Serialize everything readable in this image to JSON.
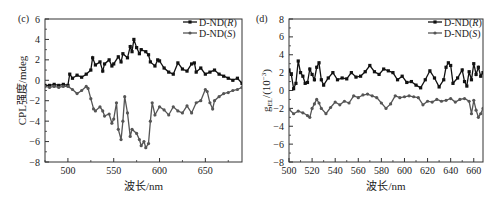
{
  "chart_data": [
    {
      "panel": "(c)",
      "type": "line",
      "title": "",
      "xlabel": "波长/nm",
      "ylabel": "CPL强度/mdeg",
      "xlim": [
        475,
        690
      ],
      "ylim": [
        -8,
        6
      ],
      "xticks": [
        500,
        550,
        600,
        650
      ],
      "yticks": [
        -8,
        -6,
        -4,
        -2,
        0,
        2,
        4,
        6
      ],
      "grid": false,
      "legend_position": "upper right",
      "series": [
        {
          "name": "D-ND(R)",
          "marker": "square",
          "color": "#111111",
          "x": [
            475,
            480,
            485,
            490,
            495,
            500,
            502,
            505,
            510,
            515,
            520,
            525,
            527,
            530,
            535,
            538,
            540,
            545,
            548,
            550,
            555,
            558,
            560,
            565,
            568,
            570,
            572,
            575,
            578,
            580,
            585,
            588,
            590,
            595,
            598,
            600,
            605,
            610,
            615,
            620,
            625,
            630,
            635,
            638,
            640,
            645,
            650,
            655,
            660,
            665,
            670,
            675,
            680,
            685,
            690
          ],
          "values": [
            -0.5,
            -0.5,
            -0.4,
            -0.5,
            -0.4,
            -0.5,
            0.6,
            0.2,
            0.5,
            0.3,
            0.6,
            1.0,
            2.2,
            1.5,
            1.8,
            0.9,
            1.6,
            2.0,
            1.4,
            1.6,
            2.3,
            1.8,
            2.6,
            2.2,
            3.3,
            2.8,
            4.0,
            3.2,
            2.6,
            3.0,
            2.8,
            2.5,
            1.8,
            1.4,
            2.0,
            1.9,
            1.2,
            0.8,
            0.6,
            1.7,
            1.1,
            0.9,
            1.6,
            1.7,
            0.8,
            1.2,
            0.6,
            0.8,
            1.0,
            0.6,
            0.4,
            0.2,
            0.0,
            0.2,
            -0.3
          ]
        },
        {
          "name": "D-ND(S)",
          "marker": "circle",
          "color": "#555555",
          "x": [
            475,
            480,
            485,
            490,
            495,
            500,
            505,
            510,
            515,
            520,
            522,
            525,
            528,
            530,
            535,
            538,
            540,
            545,
            548,
            550,
            553,
            555,
            558,
            560,
            562,
            565,
            568,
            570,
            575,
            578,
            580,
            583,
            585,
            588,
            590,
            592,
            595,
            600,
            605,
            610,
            615,
            620,
            625,
            630,
            635,
            640,
            645,
            650,
            652,
            655,
            658,
            660,
            665,
            670,
            675,
            680,
            685,
            690
          ],
          "values": [
            -0.6,
            -0.7,
            -0.6,
            -0.7,
            -0.6,
            -0.6,
            -0.9,
            -1.3,
            -1.0,
            -0.6,
            -0.8,
            -1.8,
            -2.8,
            -3.0,
            -2.6,
            -3.0,
            -3.5,
            -3.3,
            -4.2,
            -3.8,
            -2.2,
            -4.8,
            -5.8,
            -4.0,
            -1.6,
            -3.2,
            -5.5,
            -4.8,
            -5.2,
            -5.8,
            -6.4,
            -6.0,
            -6.6,
            -6.2,
            -4.0,
            -2.2,
            -3.4,
            -2.6,
            -2.9,
            -3.4,
            -2.6,
            -3.0,
            -3.2,
            -2.5,
            -3.2,
            -2.2,
            -2.0,
            -0.9,
            -1.1,
            -2.2,
            -2.8,
            -2.0,
            -1.6,
            -1.3,
            -1.2,
            -1.0,
            -0.9,
            -0.7
          ]
        }
      ]
    },
    {
      "panel": "(d)",
      "type": "line",
      "title": "",
      "xlabel": "波长/nm",
      "ylabel": "g_EL/(10^-3)",
      "xlim": [
        500,
        668
      ],
      "ylim": [
        -8,
        8
      ],
      "xticks": [
        500,
        520,
        540,
        560,
        580,
        600,
        620,
        640,
        660
      ],
      "yticks": [
        -8,
        -6,
        -4,
        -2,
        0,
        2,
        4,
        6,
        8
      ],
      "grid": false,
      "legend_position": "upper right",
      "series": [
        {
          "name": "D-ND(R)",
          "marker": "square",
          "color": "#111111",
          "x": [
            500,
            502,
            504,
            506,
            508,
            510,
            512,
            514,
            516,
            518,
            520,
            522,
            524,
            526,
            528,
            530,
            534,
            538,
            542,
            546,
            550,
            554,
            558,
            562,
            566,
            570,
            574,
            578,
            582,
            586,
            590,
            594,
            598,
            602,
            606,
            610,
            614,
            618,
            622,
            626,
            630,
            634,
            636,
            638,
            640,
            642,
            646,
            650,
            652,
            654,
            656,
            658,
            660,
            662,
            664,
            666,
            668
          ],
          "values": [
            2.3,
            1.8,
            0.2,
            0.8,
            3.3,
            2.0,
            1.6,
            0.8,
            0.9,
            2.4,
            1.8,
            1.2,
            2.6,
            3.1,
            1.2,
            0.6,
            1.4,
            2.0,
            1.2,
            1.4,
            1.3,
            2.0,
            1.5,
            1.6,
            2.1,
            2.8,
            2.1,
            1.8,
            2.4,
            2.2,
            2.0,
            1.2,
            1.6,
            0.9,
            1.0,
            0.6,
            0.3,
            1.2,
            2.2,
            1.4,
            0.4,
            1.2,
            2.6,
            3.1,
            2.8,
            0.8,
            1.4,
            2.3,
            1.0,
            0.5,
            2.1,
            1.2,
            3.0,
            1.8,
            2.6,
            1.6,
            2.0
          ]
        },
        {
          "name": "D-ND(S)",
          "marker": "circle",
          "color": "#555555",
          "x": [
            500,
            504,
            508,
            512,
            516,
            518,
            520,
            522,
            524,
            526,
            528,
            532,
            536,
            540,
            544,
            548,
            552,
            556,
            560,
            564,
            568,
            572,
            576,
            580,
            584,
            588,
            592,
            596,
            600,
            604,
            608,
            612,
            616,
            620,
            624,
            628,
            632,
            636,
            640,
            644,
            648,
            652,
            656,
            658,
            660,
            662,
            664,
            666,
            668
          ],
          "values": [
            -2.1,
            -2.6,
            -2.3,
            -2.5,
            -2.8,
            -3.0,
            -2.0,
            -1.5,
            -1.0,
            -1.4,
            -2.0,
            -2.6,
            -1.9,
            -1.3,
            -1.6,
            -1.2,
            -1.4,
            -0.6,
            -0.8,
            -0.5,
            -0.4,
            -0.6,
            -0.8,
            -1.4,
            -2.0,
            -1.5,
            -0.6,
            -0.8,
            -0.7,
            -0.6,
            -0.7,
            -0.8,
            -1.6,
            -1.2,
            -1.3,
            -1.0,
            -1.2,
            -1.1,
            -0.9,
            -1.3,
            -1.0,
            -0.9,
            -1.2,
            -2.6,
            -1.1,
            -2.2,
            -3.0,
            -2.6,
            -2.0
          ]
        }
      ]
    }
  ]
}
